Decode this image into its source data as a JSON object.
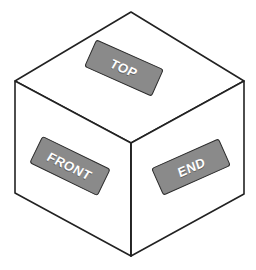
{
  "figure": {
    "name": "isometric-cube-face-labels",
    "background_color": "#ffffff",
    "outline_color": "#222222",
    "label_fill_color": "#8a8a8a",
    "label_border_color": "#2b2b2b",
    "label_text_color": "#ffffff"
  },
  "cube": {
    "geometry_note": "isometric cube drawn as outline with three visible faces",
    "vertices": {
      "top_apex": [
        131,
        12
      ],
      "left": [
        15,
        81
      ],
      "right": [
        244,
        81
      ],
      "center_front": [
        131,
        143
      ],
      "bottom_left": [
        15,
        193
      ],
      "bottom_right": [
        244,
        194
      ],
      "bottom_apex": [
        131,
        256
      ]
    },
    "faces": [
      {
        "id": "top",
        "label": "TOP"
      },
      {
        "id": "front",
        "label": "FRONT"
      },
      {
        "id": "end",
        "label": "END"
      }
    ]
  },
  "labels": {
    "top": {
      "text": "TOP",
      "rotation_deg": 24
    },
    "front": {
      "text": "FRONT",
      "rotation_deg": 26
    },
    "end": {
      "text": "END",
      "rotation_deg": -24
    }
  }
}
